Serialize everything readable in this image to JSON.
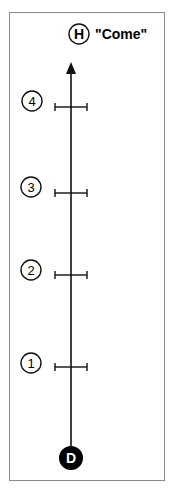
{
  "diagram": {
    "top_node": {
      "label": "H",
      "caption": "\"Come\""
    },
    "bottom_node": {
      "label": "D"
    },
    "steps": [
      {
        "label": "4"
      },
      {
        "label": "3"
      },
      {
        "label": "2"
      },
      {
        "label": "1"
      }
    ]
  },
  "colors": {
    "line": "#111111",
    "frame": "#8a8a8a",
    "node_fill": "#000000",
    "node_text": "#ffffff"
  }
}
